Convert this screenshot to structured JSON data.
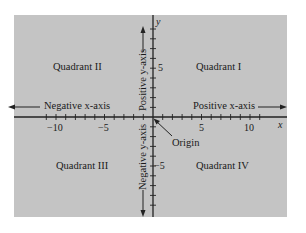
{
  "diagram": {
    "type": "cartesian-plane",
    "quadrants": {
      "q1": "Quadrant I",
      "q2": "Quadrant II",
      "q3": "Quadrant III",
      "q4": "Quadrant IV"
    },
    "axes": {
      "x_label": "x",
      "y_label": "y",
      "positive_x": "Positive x-axis",
      "negative_x": "Negative x-axis",
      "positive_y": "Positive y-axis",
      "negative_y": "Negative y-axis",
      "origin": "Origin"
    },
    "x_ticks": {
      "neg10": "−10",
      "neg5": "−5",
      "pos5": "5",
      "pos10": "10"
    },
    "y_ticks": {
      "pos5": "5",
      "neg5": "−5"
    },
    "colors": {
      "panel": "#c4c4c4",
      "axis": "#222222",
      "background": "#ffffff"
    }
  }
}
